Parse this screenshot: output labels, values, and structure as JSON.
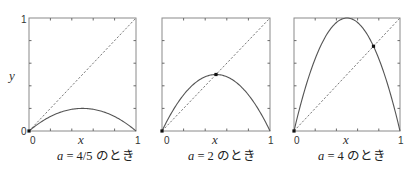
{
  "figure": {
    "y_axis_label": "y",
    "panels": [
      {
        "id": "panel-a-4-5",
        "a": 0.8,
        "caption_var": "a",
        "caption_eq": " = 4/5 ",
        "caption_suffix": "のとき",
        "x_label": "x",
        "tick_x0": "0",
        "tick_x1": "1",
        "tick_y0": "0",
        "tick_y1": "1",
        "fixed_point": [
          0,
          0
        ]
      },
      {
        "id": "panel-a-2",
        "a": 2,
        "caption_var": "a",
        "caption_eq": " = 2 ",
        "caption_suffix": "のとき",
        "x_label": "x",
        "tick_x0": "0",
        "tick_x1": "1",
        "fixed_point": [
          0.5,
          0.5
        ]
      },
      {
        "id": "panel-a-4",
        "a": 4,
        "caption_var": "a",
        "caption_eq": " = 4 ",
        "caption_suffix": "のとき",
        "x_label": "x",
        "tick_x0": "0",
        "tick_x1": "1",
        "fixed_point": [
          0.75,
          0.75
        ]
      }
    ]
  },
  "chart_data": [
    {
      "type": "line",
      "title": "a = 4/5 のとき",
      "xlabel": "x",
      "ylabel": "y",
      "xlim": [
        0,
        1
      ],
      "ylim": [
        0,
        1
      ],
      "series": [
        {
          "name": "y = a x (1 - x), a = 4/5",
          "x": [
            0,
            0.1,
            0.2,
            0.3,
            0.4,
            0.5,
            0.6,
            0.7,
            0.8,
            0.9,
            1.0
          ],
          "y": [
            0,
            0.072,
            0.128,
            0.168,
            0.192,
            0.2,
            0.192,
            0.168,
            0.128,
            0.072,
            0
          ]
        },
        {
          "name": "y = x (dashed)",
          "x": [
            0,
            1
          ],
          "y": [
            0,
            1
          ]
        }
      ],
      "points": [
        {
          "x": 0,
          "y": 0,
          "label": "fixed point"
        }
      ],
      "grid": false,
      "tick_labels_x": [
        "0",
        "1"
      ],
      "tick_labels_y": [
        "0",
        "1"
      ]
    },
    {
      "type": "line",
      "title": "a = 2 のとき",
      "xlabel": "x",
      "ylabel": "",
      "xlim": [
        0,
        1
      ],
      "ylim": [
        0,
        1
      ],
      "series": [
        {
          "name": "y = a x (1 - x), a = 2",
          "x": [
            0,
            0.1,
            0.2,
            0.3,
            0.4,
            0.5,
            0.6,
            0.7,
            0.8,
            0.9,
            1.0
          ],
          "y": [
            0,
            0.18,
            0.32,
            0.42,
            0.48,
            0.5,
            0.48,
            0.42,
            0.32,
            0.18,
            0
          ]
        },
        {
          "name": "y = x (dashed)",
          "x": [
            0,
            1
          ],
          "y": [
            0,
            1
          ]
        }
      ],
      "points": [
        {
          "x": 0,
          "y": 0
        },
        {
          "x": 0.5,
          "y": 0.5,
          "label": "fixed point"
        }
      ],
      "grid": false,
      "tick_labels_x": [
        "0",
        "1"
      ]
    },
    {
      "type": "line",
      "title": "a = 4 のとき",
      "xlabel": "x",
      "ylabel": "",
      "xlim": [
        0,
        1
      ],
      "ylim": [
        0,
        1
      ],
      "series": [
        {
          "name": "y = a x (1 - x), a = 4",
          "x": [
            0,
            0.1,
            0.2,
            0.3,
            0.4,
            0.5,
            0.6,
            0.7,
            0.8,
            0.9,
            1.0
          ],
          "y": [
            0,
            0.36,
            0.64,
            0.84,
            0.96,
            1.0,
            0.96,
            0.84,
            0.64,
            0.36,
            0
          ]
        },
        {
          "name": "y = x (dashed)",
          "x": [
            0,
            1
          ],
          "y": [
            0,
            1
          ]
        }
      ],
      "points": [
        {
          "x": 0,
          "y": 0
        },
        {
          "x": 0.75,
          "y": 0.75,
          "label": "fixed point"
        }
      ],
      "grid": false,
      "tick_labels_x": [
        "0",
        "1"
      ]
    }
  ]
}
